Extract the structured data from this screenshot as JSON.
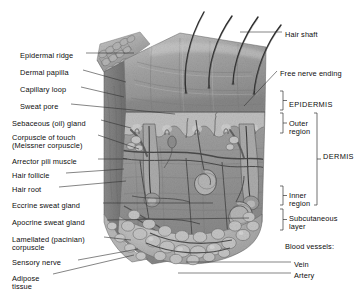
{
  "figure": {
    "type": "anatomical-illustration",
    "style": "grayscale airbrush / pencil rendering",
    "background_color": "#ffffff",
    "text_color": "#0d0d0d",
    "leader_line_color": "#333333"
  },
  "labels_left": [
    {
      "id": "epidermal-ridge",
      "text": "Epidermal ridge",
      "x": 20,
      "y": 52
    },
    {
      "id": "dermal-papilla",
      "text": "Dermal papilla",
      "x": 20,
      "y": 69
    },
    {
      "id": "capillary-loop",
      "text": "Capillary loop",
      "x": 20,
      "y": 86
    },
    {
      "id": "sweat-pore",
      "text": "Sweat pore",
      "x": 20,
      "y": 103
    },
    {
      "id": "sebaceous-gland",
      "text": "Sebaceous (oil) gland",
      "x": 12,
      "y": 120
    },
    {
      "id": "corpuscle-of-touch",
      "text": "Corpuscle of touch",
      "x": 12,
      "y": 134
    },
    {
      "id": "meissner-corpuscle",
      "text": "(Meissner corpuscle)",
      "x": 12,
      "y": 142
    },
    {
      "id": "arrector-pili-muscle",
      "text": "Arrector pili muscle",
      "x": 12,
      "y": 158
    },
    {
      "id": "hair-follicle",
      "text": "Hair follicle",
      "x": 12,
      "y": 172
    },
    {
      "id": "hair-root",
      "text": "Hair root",
      "x": 12,
      "y": 186
    },
    {
      "id": "eccrine-sweat-gland",
      "text": "Eccrine sweat gland",
      "x": 12,
      "y": 202
    },
    {
      "id": "apocrine-sweat-gland",
      "text": "Apocrine sweat gland",
      "x": 12,
      "y": 219
    },
    {
      "id": "lamellated-corpuscle-1",
      "text": "Lamellated (pacinian)",
      "x": 12,
      "y": 236
    },
    {
      "id": "lamellated-corpuscle-2",
      "text": "corpuscle",
      "x": 12,
      "y": 244
    },
    {
      "id": "sensory-nerve",
      "text": "Sensory nerve",
      "x": 12,
      "y": 259
    },
    {
      "id": "adipose-tissue-1",
      "text": "Adipose",
      "x": 12,
      "y": 275
    },
    {
      "id": "adipose-tissue-2",
      "text": "tissue",
      "x": 12,
      "y": 283
    }
  ],
  "labels_right": [
    {
      "id": "hair-shaft",
      "text": "Hair shaft",
      "x": 285,
      "y": 31
    },
    {
      "id": "free-nerve-ending",
      "text": "Free nerve ending",
      "x": 280,
      "y": 70
    },
    {
      "id": "epidermis",
      "text": "EPIDERMIS",
      "x": 289,
      "y": 101,
      "caps": true
    },
    {
      "id": "outer-region-1",
      "text": "Outer",
      "x": 289,
      "y": 120
    },
    {
      "id": "outer-region-2",
      "text": "region",
      "x": 289,
      "y": 128
    },
    {
      "id": "dermis",
      "text": "DERMIS",
      "x": 323,
      "y": 153,
      "caps": true
    },
    {
      "id": "inner-region-1",
      "text": "Inner",
      "x": 289,
      "y": 192
    },
    {
      "id": "inner-region-2",
      "text": "region",
      "x": 289,
      "y": 200
    },
    {
      "id": "subcutaneous-layer-1",
      "text": "Subcutaneous",
      "x": 289,
      "y": 215
    },
    {
      "id": "subcutaneous-layer-2",
      "text": "layer",
      "x": 289,
      "y": 223
    },
    {
      "id": "blood-vessels-header",
      "text": "Blood vessels:",
      "x": 285,
      "y": 243
    },
    {
      "id": "vein",
      "text": "Vein",
      "x": 294,
      "y": 261
    },
    {
      "id": "artery",
      "text": "Artery",
      "x": 294,
      "y": 272
    }
  ],
  "brackets": [
    {
      "id": "epidermis-bracket",
      "label": "EPIDERMIS",
      "x": 283,
      "y_top": 91,
      "y_bottom": 110
    },
    {
      "id": "outer-region-bracket",
      "label": "Outer region",
      "x": 283,
      "y_top": 113,
      "y_bottom": 133
    },
    {
      "id": "inner-region-bracket",
      "label": "Inner region",
      "x": 283,
      "y_top": 186,
      "y_bottom": 205
    },
    {
      "id": "dermis-bracket",
      "label": "DERMIS",
      "x": 317,
      "y_top": 113,
      "y_bottom": 205
    },
    {
      "id": "subcutaneous-bracket",
      "label": "Subcutaneous layer",
      "x": 283,
      "y_top": 209,
      "y_bottom": 230
    }
  ],
  "leaders_left": [
    {
      "id": "leader-epidermal-ridge",
      "x1": 86,
      "y1": 53,
      "x2": 134,
      "y2": 53
    },
    {
      "id": "leader-dermal-papilla",
      "x1": 83,
      "y1": 70,
      "x2": 126,
      "y2": 82
    },
    {
      "id": "leader-capillary-loop",
      "x1": 81,
      "y1": 87,
      "x2": 124,
      "y2": 97
    },
    {
      "id": "leader-sweat-pore",
      "x1": 71,
      "y1": 104,
      "x2": 175,
      "y2": 114
    },
    {
      "id": "leader-sebaceous-gland",
      "x1": 101,
      "y1": 120,
      "x2": 131,
      "y2": 128
    },
    {
      "id": "leader-corpuscle-touch",
      "x1": 98,
      "y1": 135,
      "x2": 139,
      "y2": 149
    },
    {
      "id": "leader-arrector-pili",
      "x1": 98,
      "y1": 159,
      "x2": 127,
      "y2": 159
    },
    {
      "id": "leader-hair-follicle",
      "x1": 66,
      "y1": 173,
      "x2": 124,
      "y2": 169
    },
    {
      "id": "leader-hair-root",
      "x1": 59,
      "y1": 187,
      "x2": 126,
      "y2": 181
    },
    {
      "id": "leader-eccrine",
      "x1": 103,
      "y1": 203,
      "x2": 213,
      "y2": 203
    },
    {
      "id": "leader-apocrine",
      "x1": 107,
      "y1": 220,
      "x2": 249,
      "y2": 218
    },
    {
      "id": "leader-lamellated",
      "x1": 104,
      "y1": 237,
      "x2": 131,
      "y2": 240
    },
    {
      "id": "leader-sensory-nerve",
      "x1": 78,
      "y1": 260,
      "x2": 138,
      "y2": 249
    },
    {
      "id": "leader-adipose",
      "x1": 53,
      "y1": 274,
      "x2": 134,
      "y2": 255
    }
  ],
  "leaders_right": [
    {
      "id": "leader-hair-shaft",
      "x1": 282,
      "y1": 32,
      "x2": 240,
      "y2": 32
    },
    {
      "id": "leader-free-nerve-ending",
      "x1": 277,
      "y1": 71,
      "x2": 244,
      "y2": 106
    },
    {
      "id": "leader-vein",
      "x1": 291,
      "y1": 262,
      "x2": 186,
      "y2": 262
    },
    {
      "id": "leader-artery",
      "x1": 291,
      "y1": 273,
      "x2": 178,
      "y2": 273
    }
  ],
  "hair_shafts": [
    {
      "id": "hair-shaft-1",
      "path": "M 186 93 C 183 70 188 40 204 12"
    },
    {
      "id": "hair-shaft-2",
      "path": "M 209 88 C 208 66 215 40 232 16"
    },
    {
      "id": "hair-shaft-3",
      "path": "M 233 84 C 234 62 243 38 258 17"
    },
    {
      "id": "hair-shaft-4",
      "path": "M 254 94 C 256 70 266 44 281 25"
    }
  ],
  "skin_block": {
    "surface_tone": "#a5a5a5",
    "dermis_tone": "#949494",
    "subcutaneous_tone": "#b0b0b0",
    "outline": "#6a6a6a"
  }
}
